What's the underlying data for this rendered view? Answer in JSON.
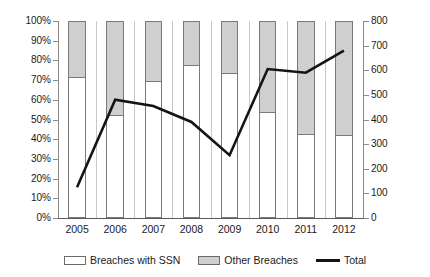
{
  "chart_data": {
    "type": "bar",
    "title": "",
    "subtitle": "",
    "xlabel": "",
    "ylabel": "",
    "categories": [
      "2005",
      "2006",
      "2007",
      "2008",
      "2009",
      "2010",
      "2011",
      "2012"
    ],
    "grid": false,
    "legend_position": "bottom",
    "axes": {
      "left": {
        "label": "",
        "ylim": [
          0,
          100
        ],
        "tick_step": 10,
        "tick_labels": [
          "0%",
          "10%",
          "20%",
          "30%",
          "40%",
          "50%",
          "60%",
          "70%",
          "80%",
          "90%",
          "100%"
        ],
        "tick_values": [
          0,
          10,
          20,
          30,
          40,
          50,
          60,
          70,
          80,
          90,
          100
        ],
        "unit": "percent",
        "applies_to": [
          "Breaches with SSN",
          "Other Breaches"
        ]
      },
      "right": {
        "label": "",
        "ylim": [
          0,
          800
        ],
        "tick_step": 100,
        "tick_labels": [
          "0",
          "100",
          "200",
          "300",
          "400",
          "500",
          "600",
          "700",
          "800"
        ],
        "tick_values": [
          0,
          100,
          200,
          300,
          400,
          500,
          600,
          700,
          800
        ],
        "unit": "count",
        "applies_to": [
          "Total"
        ]
      }
    },
    "series": [
      {
        "name": "Breaches with SSN",
        "type": "bar-stacked",
        "axis": "left",
        "color": "#ffffff",
        "border_color": "#7a7a7a",
        "values": [
          71,
          52,
          69,
          77,
          73,
          53.5,
          42,
          41.5
        ]
      },
      {
        "name": "Other Breaches",
        "type": "bar-stacked",
        "axis": "left",
        "color": "#cfcfcf",
        "border_color": "#7a7a7a",
        "values": [
          29,
          48,
          31,
          23,
          27,
          46.5,
          58,
          58.5
        ]
      },
      {
        "name": "Total",
        "type": "line",
        "axis": "right",
        "color": "#141414",
        "values": [
          125,
          480,
          455,
          390,
          255,
          605,
          590,
          680
        ]
      }
    ]
  },
  "legend": {
    "items": [
      {
        "label": "Breaches with SSN",
        "marker": "swatch-white"
      },
      {
        "label": "Other Breaches",
        "marker": "swatch-gray"
      },
      {
        "label": "Total",
        "marker": "line-black"
      }
    ]
  }
}
